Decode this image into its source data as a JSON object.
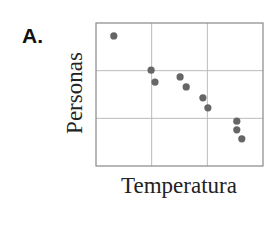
{
  "panel_label": "A.",
  "colors": {
    "frame": "#888888",
    "grid": "#bbbbbb",
    "point": "#666666",
    "text": "#222222"
  },
  "chart_data": {
    "type": "scatter",
    "title": "",
    "panel": "A.",
    "xlabel": "Temperatura",
    "ylabel": "Personas",
    "xlim": [
      0,
      3
    ],
    "ylim": [
      0,
      3
    ],
    "grid": true,
    "grid_divisions": {
      "x": 3,
      "y": 3
    },
    "tick_labels": {
      "x": [],
      "y": []
    },
    "legend": null,
    "trend": "negative correlation",
    "points": [
      {
        "x": 0.32,
        "y": 2.73
      },
      {
        "x": 0.99,
        "y": 2.01
      },
      {
        "x": 1.06,
        "y": 1.76
      },
      {
        "x": 1.51,
        "y": 1.87
      },
      {
        "x": 1.62,
        "y": 1.66
      },
      {
        "x": 1.92,
        "y": 1.43
      },
      {
        "x": 2.01,
        "y": 1.22
      },
      {
        "x": 2.53,
        "y": 0.94
      },
      {
        "x": 2.53,
        "y": 0.76
      },
      {
        "x": 2.62,
        "y": 0.57
      }
    ]
  }
}
